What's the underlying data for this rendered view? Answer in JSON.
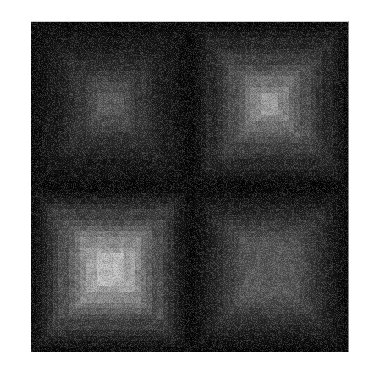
{
  "figure": {
    "title": "",
    "background_color": "#ffffff",
    "panel_background_color": "#000000",
    "panel_left": 31,
    "panel_top": 21,
    "panel_width": 318,
    "panel_height": 331
  },
  "chart_data": {
    "type": "heatmap",
    "title": "",
    "subtitle": "",
    "xlabel": "",
    "ylabel": "",
    "colormap": "gray",
    "grid": false,
    "legend": "none",
    "xticklabels": [],
    "yticklabels": [],
    "layout": {
      "rows": 2,
      "cols": 2,
      "panel_gap_px": 0
    },
    "value_range": [
      0,
      255
    ],
    "description": "Two-by-two grid of grayscale rasters; each tile contains nested concentric square rings (Chebyshev-distance pyramid) stepping from a near-black border up to a bright center plateau.",
    "panels": [
      {
        "id": "top-left",
        "row": 0,
        "col": 0,
        "peak_value": 86,
        "floor_value": 6,
        "plateau_radius": 0.1,
        "ring_count": 11,
        "falloff": 1.0,
        "ring_values": [
          6,
          10,
          14,
          19,
          25,
          31,
          39,
          48,
          58,
          70,
          86
        ]
      },
      {
        "id": "top-right",
        "row": 0,
        "col": 1,
        "peak_value": 152,
        "floor_value": 6,
        "plateau_radius": 0.08,
        "ring_count": 11,
        "falloff": 1.0,
        "ring_values": [
          6,
          13,
          22,
          32,
          44,
          57,
          72,
          88,
          106,
          127,
          152
        ]
      },
      {
        "id": "bottom-left",
        "row": 1,
        "col": 0,
        "peak_value": 186,
        "floor_value": 8,
        "plateau_radius": 0.16,
        "ring_count": 11,
        "falloff": 1.0,
        "ring_values": [
          8,
          17,
          28,
          41,
          56,
          73,
          92,
          112,
          134,
          159,
          186
        ]
      },
      {
        "id": "bottom-right",
        "row": 1,
        "col": 1,
        "peak_value": 82,
        "floor_value": 6,
        "plateau_radius": 0.3,
        "ring_count": 11,
        "falloff": 1.0,
        "ring_values": [
          6,
          11,
          17,
          24,
          31,
          39,
          48,
          57,
          66,
          74,
          82
        ]
      }
    ]
  },
  "panels_meta": {
    "top_left_name": "heatmap-tile-top-left",
    "top_right_name": "heatmap-tile-top-right",
    "bottom_left_name": "heatmap-tile-bottom-left",
    "bottom_right_name": "heatmap-tile-bottom-right"
  }
}
